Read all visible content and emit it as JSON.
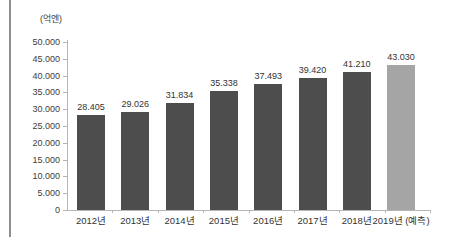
{
  "chart_data": {
    "type": "bar",
    "title": "",
    "unit_label": "(억엔)",
    "categories": [
      "2012년",
      "2013년",
      "2014년",
      "2015년",
      "2016년",
      "2017년",
      "2018년",
      "2019년 (예측)"
    ],
    "values": [
      28405,
      29026,
      31834,
      35338,
      37493,
      39420,
      41210,
      43030
    ],
    "value_labels": [
      "28.405",
      "29.026",
      "31.834",
      "35.338",
      "37.493",
      "39.420",
      "41.210",
      "43.030"
    ],
    "ylim": [
      0,
      50000
    ],
    "ytick_step": 5000,
    "ytick_labels": [
      "0",
      "5.000",
      "10.000",
      "15.000",
      "20.000",
      "25.000",
      "30.000",
      "35.000",
      "40.000",
      "45.000",
      "50.000"
    ],
    "grid": false,
    "legend": "none",
    "bar_color": "#4d4d4d",
    "forecast_bar_color": "#a5a5a5",
    "forecast_index": 7,
    "axis_color": "#b5b5b5",
    "text_color": "#333333",
    "frame_line_color": "#8f8f8f"
  }
}
